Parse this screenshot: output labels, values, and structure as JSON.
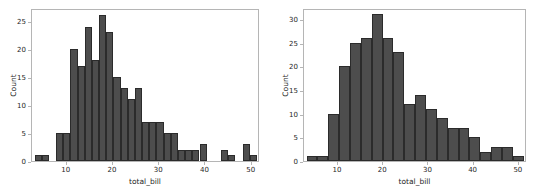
{
  "figure": {
    "background": "#ffffff",
    "bar_fill": "#4d4d4d",
    "bar_edge": "#2b2b2b",
    "spine_color": "#b5b5b5",
    "text_color": "#262626"
  },
  "chart_data": [
    {
      "type": "bar",
      "subtype": "histogram",
      "panel": "left",
      "title": "",
      "xlabel": "total_bill",
      "ylabel": "Count",
      "xlim": [
        2.5,
        51.8
      ],
      "ylim": [
        0,
        27.3
      ],
      "grid": false,
      "legend": null,
      "xticks": [
        10,
        20,
        30,
        40,
        50
      ],
      "xticklabels": [
        "10",
        "20",
        "30",
        "40",
        "50"
      ],
      "yticks": [
        0,
        5,
        10,
        15,
        20,
        25
      ],
      "yticklabels": [
        "0",
        "5",
        "10",
        "15",
        "20",
        "25"
      ],
      "bin_width": 1.55,
      "bin_edges": [
        3.07,
        4.62,
        6.17,
        7.72,
        9.27,
        10.82,
        12.37,
        13.92,
        15.47,
        17.02,
        18.57,
        20.12,
        21.67,
        23.22,
        24.77,
        26.32,
        27.87,
        29.42,
        30.97,
        32.52,
        34.07,
        35.62,
        37.17,
        38.72,
        40.27,
        41.82,
        43.37,
        44.92,
        46.47,
        48.02,
        49.57,
        51.12
      ],
      "values": [
        1,
        1,
        0,
        5,
        5,
        20,
        17,
        24,
        18,
        26,
        23,
        15,
        13,
        11,
        13,
        7,
        7,
        7,
        5,
        5,
        2,
        2,
        2,
        3,
        0,
        0,
        2,
        1,
        0,
        3,
        1
      ]
    },
    {
      "type": "bar",
      "subtype": "histogram",
      "panel": "right",
      "title": "",
      "xlabel": "total_bill",
      "ylabel": "Count",
      "xlim": [
        2.5,
        51.8
      ],
      "ylim": [
        0,
        32.3
      ],
      "grid": false,
      "legend": null,
      "xticks": [
        10,
        20,
        30,
        40,
        50
      ],
      "xticklabels": [
        "10",
        "20",
        "30",
        "40",
        "50"
      ],
      "yticks": [
        0,
        5,
        10,
        15,
        20,
        25,
        30
      ],
      "yticklabels": [
        "0",
        "5",
        "10",
        "15",
        "20",
        "25",
        "30"
      ],
      "bin_width": 2.4,
      "bin_edges": [
        3.07,
        5.47,
        7.87,
        10.27,
        12.67,
        15.07,
        17.47,
        19.87,
        22.27,
        24.67,
        27.07,
        29.47,
        31.87,
        34.27,
        36.67,
        39.07,
        41.47,
        43.87,
        46.27,
        48.67,
        51.07
      ],
      "values": [
        1,
        1,
        10,
        20,
        25,
        26,
        31,
        26,
        23,
        12,
        14,
        11,
        9,
        7,
        7,
        5,
        2,
        3,
        3,
        1,
        2,
        1,
        3,
        1
      ]
    }
  ]
}
